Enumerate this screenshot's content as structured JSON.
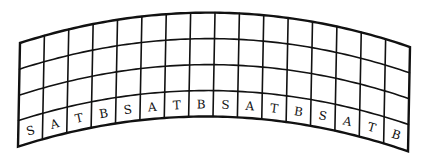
{
  "figure": {
    "columns": 16,
    "rows": 4,
    "line_color": "#111111",
    "background": "#ffffff"
  },
  "bottom_row_labels": [
    "S",
    "A",
    "T",
    "B",
    "S",
    "A",
    "T",
    "B",
    "S",
    "A",
    "T",
    "B",
    "S",
    "A",
    "T",
    "B"
  ],
  "geometry": {
    "left_x": 20,
    "right_x": 410,
    "peak_x": 230,
    "left_edge_y": [
      43,
      69,
      95,
      120,
      146
    ],
    "right_edge_y": [
      47,
      73,
      99,
      125,
      152
    ],
    "peak_y": [
      13,
      39,
      65,
      91,
      117
    ]
  }
}
